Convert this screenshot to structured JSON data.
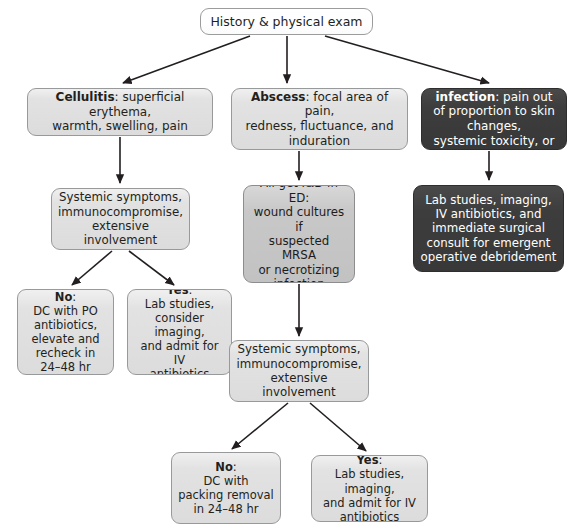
{
  "diagram": {
    "colors": {
      "background": "#ffffff",
      "box_white": "#ffffff",
      "box_light_gray": "#dcdcdc",
      "box_mid_gray": "#c2c2c2",
      "box_dark_gray": "#3d3d3d",
      "border": "#8e9092",
      "text": "#231f20",
      "text_inverse": "#ffffff",
      "connector": "#231f20"
    },
    "nodes": {
      "root": {
        "text": "History & physical exam",
        "fill": "white"
      },
      "cellulitis": {
        "lead": "Cellulitis",
        "text": ": superficial erythema,\nwarmth, swelling, pain",
        "fill": "light"
      },
      "abscess": {
        "lead": "Abscess",
        "text": ": focal area of pain,\nredness, fluctuance, and\ninduration",
        "fill": "light"
      },
      "necrotizing": {
        "lead": "Necrotizing infection",
        "text": ": pain out\nof proportion to skin changes,\nsystemic toxicity, or crepitus",
        "fill": "dark"
      },
      "cellulitis_symptoms": {
        "text": "Systemic symptoms,\nimmunocompromise,\nextensive involvement",
        "fill": "light"
      },
      "abscess_incision_drainage": {
        "text": "All get I&D in ED:\nwound cultures if\nsuspected MRSA\nor necrotizing\ninfection",
        "fill": "mid"
      },
      "necrotizing_management": {
        "text": "Lab studies, imaging,\nIV antibiotics, and\nimmediate surgical\nconsult for emergent\noperative debridement",
        "fill": "dark"
      },
      "cellulitis_no": {
        "lead": "No",
        "text": ":\nDC with PO\nantibiotics,\nelevate and\nrecheck in\n24–48 hr",
        "fill": "light"
      },
      "cellulitis_yes": {
        "lead": "Yes",
        "text": ":\nLab studies,\nconsider imaging,\nand admit for IV\nantibiotics",
        "fill": "light"
      },
      "abscess_symptoms": {
        "text": "Systemic symptoms,\nimmunocompromise,\nextensive involvement",
        "fill": "light"
      },
      "abscess_no": {
        "lead": "No",
        "text": ":\nDC with\npacking removal\nin 24–48 hr",
        "fill": "light"
      },
      "abscess_yes": {
        "lead": "Yes",
        "text": ":\nLab studies, imaging,\nand admit for IV\nantibiotics",
        "fill": "light"
      }
    },
    "edges": [
      {
        "from": "root",
        "to": "cellulitis"
      },
      {
        "from": "root",
        "to": "abscess"
      },
      {
        "from": "root",
        "to": "necrotizing"
      },
      {
        "from": "cellulitis",
        "to": "cellulitis_symptoms"
      },
      {
        "from": "abscess",
        "to": "abscess_incision_drainage"
      },
      {
        "from": "necrotizing",
        "to": "necrotizing_management"
      },
      {
        "from": "cellulitis_symptoms",
        "to": "cellulitis_no"
      },
      {
        "from": "cellulitis_symptoms",
        "to": "cellulitis_yes"
      },
      {
        "from": "abscess_incision_drainage",
        "to": "abscess_symptoms"
      },
      {
        "from": "abscess_symptoms",
        "to": "abscess_no"
      },
      {
        "from": "abscess_symptoms",
        "to": "abscess_yes"
      }
    ]
  }
}
